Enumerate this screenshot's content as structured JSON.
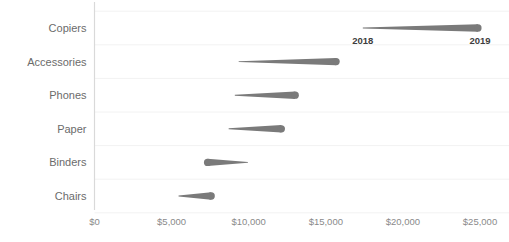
{
  "chart_data": {
    "type": "bar",
    "subtype": "dumbbell-arrow-slope",
    "title": "",
    "subtitle": "",
    "xlabel": "",
    "ylabel": "",
    "grid": true,
    "legend_position": "inline-first-row",
    "xlim": [
      0,
      25000
    ],
    "x_ticks": [
      0,
      5000,
      10000,
      15000,
      20000,
      25000
    ],
    "x_tick_labels": [
      "$0",
      "$5,000",
      "$10,000",
      "$15,000",
      "$20,000",
      "$25,000"
    ],
    "categories": [
      "Copiers",
      "Accessories",
      "Phones",
      "Paper",
      "Binders",
      "Chairs"
    ],
    "series": [
      {
        "name": "2018",
        "values": [
          17400,
          9350,
          9100,
          8700,
          9950,
          5450
        ]
      },
      {
        "name": "2019",
        "values": [
          25000,
          15800,
          13150,
          12250,
          7200,
          7700
        ]
      }
    ],
    "points": [
      {
        "category": "Copiers",
        "start": 17400,
        "end": 25000,
        "direction": "increase"
      },
      {
        "category": "Accessories",
        "start": 9350,
        "end": 15800,
        "direction": "increase"
      },
      {
        "category": "Phones",
        "start": 9100,
        "end": 13150,
        "direction": "increase"
      },
      {
        "category": "Paper",
        "start": 8700,
        "end": 12250,
        "direction": "increase"
      },
      {
        "category": "Binders",
        "start": 9950,
        "end": 7200,
        "direction": "decrease"
      },
      {
        "category": "Chairs",
        "start": 5450,
        "end": 7700,
        "direction": "increase"
      }
    ],
    "annotations": [
      {
        "text": "2018",
        "at_category": "Copiers",
        "at_value": 17400
      },
      {
        "text": "2019",
        "at_category": "Copiers",
        "at_value": 25000
      }
    ],
    "colors": {
      "mark": "#7a7a7a",
      "axis": "#d9d9d9",
      "grid": "#f2f2f2",
      "tick_text": "#8a8a8a",
      "category_text": "#6b6b6b",
      "annotation_text": "#3d3d3d",
      "background": "#ffffff"
    }
  }
}
